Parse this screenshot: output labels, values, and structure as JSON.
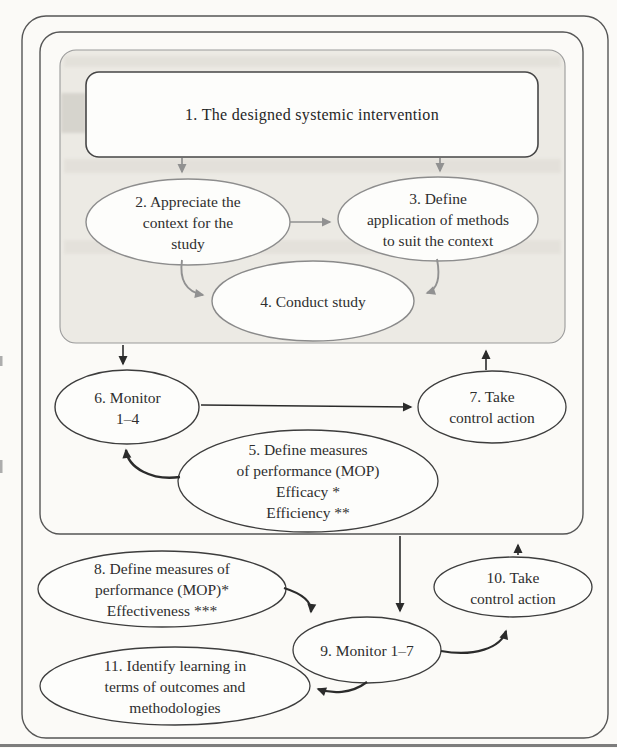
{
  "figure": {
    "type": "flowchart",
    "colors": {
      "paper": "#fbfaf7",
      "ink": "#2e2e2e",
      "shaded_region_fill": "#ECEAE4",
      "node_fill": "#FDFDFB",
      "frame_stroke": "#565656",
      "upper_node_stroke": "#8d8d8d",
      "lower_node_stroke": "#3d3d3d",
      "gray_arrow": "#919191",
      "black_arrow": "#2b2b2b"
    },
    "nodes": {
      "step1": {
        "label": "1. The designed systemic intervention"
      },
      "step2": {
        "label": "2. Appreciate the\ncontext for the\nstudy"
      },
      "step3": {
        "label": "3. Define\napplication of methods\nto suit the context"
      },
      "step4": {
        "label": "4. Conduct study"
      },
      "step5": {
        "label": "5. Define measures\nof performance (MOP)\nEfficacy *\nEfficiency **"
      },
      "step6": {
        "label": "6. Monitor\n1–4"
      },
      "step7": {
        "label": "7. Take\ncontrol action"
      },
      "step8": {
        "label": "8. Define measures of\nperformance (MOP)*\nEffectiveness ***"
      },
      "step9": {
        "label": "9. Monitor 1–7"
      },
      "step10": {
        "label": "10. Take\ncontrol action"
      },
      "step11": {
        "label": "11. Identify learning in\nterms of outcomes and\nmethodologies"
      }
    },
    "edges": [
      {
        "from": "step1",
        "to": "step2",
        "style": "gray-straight"
      },
      {
        "from": "step1",
        "to": "step3",
        "style": "gray-straight"
      },
      {
        "from": "step2",
        "to": "step3",
        "style": "gray-straight"
      },
      {
        "from": "step2",
        "to": "step4",
        "style": "gray-curved"
      },
      {
        "from": "step3",
        "to": "step4",
        "style": "gray-curved"
      },
      {
        "from": "shaded-region",
        "to": "step6",
        "style": "black-straight"
      },
      {
        "from": "step6",
        "to": "step7",
        "style": "black-straight"
      },
      {
        "from": "step7",
        "to": "shaded-region",
        "style": "black-straight"
      },
      {
        "from": "step5",
        "to": "step6",
        "style": "black-curved"
      },
      {
        "from": "inner-boundary",
        "to": "step9",
        "style": "black-straight"
      },
      {
        "from": "step10",
        "to": "inner-boundary",
        "style": "black-straight"
      },
      {
        "from": "step8",
        "to": "step9",
        "style": "black-curved"
      },
      {
        "from": "step9",
        "to": "step10",
        "style": "black-curved"
      },
      {
        "from": "step9",
        "to": "step11",
        "style": "black-curved"
      }
    ]
  }
}
